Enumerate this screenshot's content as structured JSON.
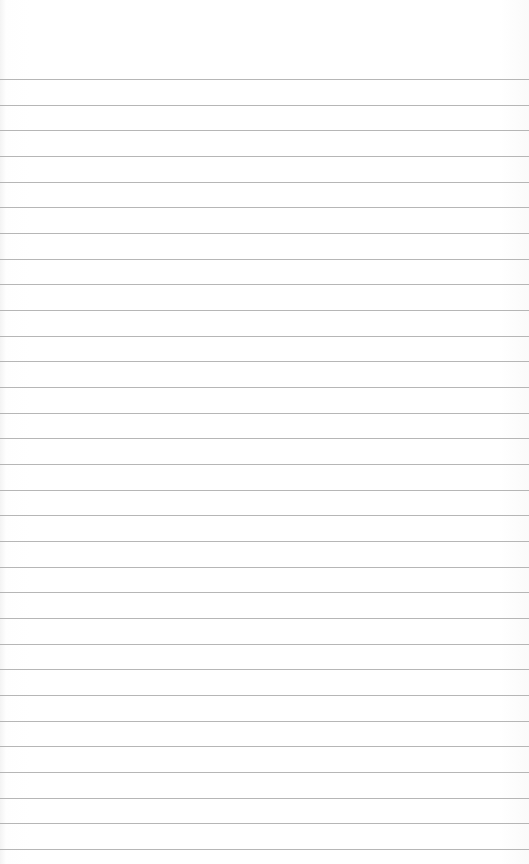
{
  "paper": {
    "background": "#ffffff",
    "line_color": "#a9a9a9",
    "first_line_y": 79,
    "line_spacing": 25.67,
    "line_count": 31
  }
}
